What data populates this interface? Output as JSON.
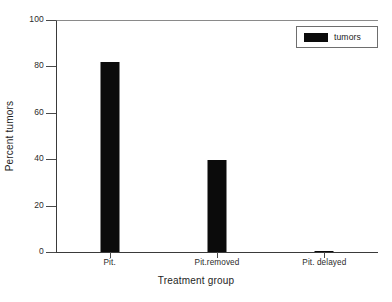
{
  "chart_data": {
    "type": "bar",
    "title": "",
    "categories": [
      "Pit.",
      "Pit.removed",
      "Pit. delayed"
    ],
    "values": [
      82,
      39.5,
      0.5
    ],
    "series": [
      {
        "name": "tumors",
        "values": [
          82,
          39.5,
          0.5
        ],
        "color": "#0b0b0b"
      }
    ],
    "xlabel": "Treatment group",
    "ylabel": "Percent tumors",
    "ylim": [
      0,
      100
    ],
    "yticks": [
      0,
      20,
      40,
      60,
      80,
      100
    ],
    "ytick_labels": [
      "0",
      "20",
      "40",
      "60",
      "80",
      "100"
    ],
    "grid": false,
    "legend": {
      "position": "top-right",
      "entries": [
        "tumors"
      ]
    }
  },
  "legend": {
    "entries": [
      {
        "label": "tumors",
        "color": "#0b0b0b"
      }
    ]
  },
  "axes": {
    "x_title": "Treatment group",
    "y_title": "Percent tumors"
  }
}
